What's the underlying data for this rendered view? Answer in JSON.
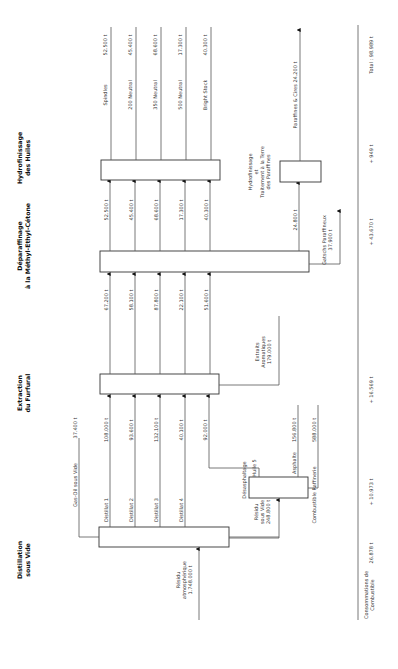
{
  "stages": {
    "distillation": {
      "line1": "Distillation",
      "line2": "sous Vide"
    },
    "extraction": {
      "line1": "Extraction",
      "line2": "du Furfural"
    },
    "deparaffinage": {
      "line1": "Déparaffinage",
      "line2": "à la Méthyl-Ethyl-Cétone"
    },
    "hydrofinissage": {
      "line1": "Hydrofinissage",
      "line2": "des Huiles"
    }
  },
  "feed": {
    "line1": "Résidu",
    "line2": "atmosphérique",
    "line3": "1.748.000 t"
  },
  "gasoil": {
    "label": "Gas-Oil sous Vide",
    "value": "37.400 t"
  },
  "distillates": [
    {
      "label": "Distillat 1",
      "value": "108.000 t"
    },
    {
      "label": "Distillat 2",
      "value": "93.600 t"
    },
    {
      "label": "Distillat 3",
      "value": "132.100 t"
    },
    {
      "label": "Distillat 4",
      "value": "40.100 t"
    },
    {
      "label": "",
      "value": "92.000 t"
    }
  ],
  "residu_vide": {
    "line1": "Résidu",
    "line2": "sous Vide",
    "line3": "248.800 t"
  },
  "desasphaltage": {
    "label": "Désasphaltage",
    "huile5": "Huile 5",
    "asphalte": "Asphalte",
    "asphalte_value": "156.800 t"
  },
  "combustible_raffinerie": {
    "label": "Combustible Raffinerie",
    "value": "588.000 t"
  },
  "raffinats": [
    "67.200 t",
    "58.100 t",
    "87.800 t",
    "22.100 t",
    "51.600 t"
  ],
  "extraits": {
    "line1": "Extraits",
    "line2": "Aromatiques",
    "line3": "179.000 t"
  },
  "deparaffined_oils": [
    "52.500 t",
    "45.400 t",
    "68.600 t",
    "17.300 t",
    "40.300 t"
  ],
  "gatsch": {
    "value": "24.800 t",
    "label": "Gatschs Paraffineux",
    "label_value": "37.900 t"
  },
  "hydrofinissage_paraffines": {
    "line1": "Hydrofinissage",
    "line2": "et",
    "line3": "Traitement à la Terre",
    "line4": "des Paraffines"
  },
  "products": [
    {
      "label": "Spindles",
      "value": "52.500 t"
    },
    {
      "label": "200 Neutral",
      "value": "45.400 t"
    },
    {
      "label": "350 Neutral",
      "value": "68.600 t"
    },
    {
      "label": "500 Neutral",
      "value": "17.300 t"
    },
    {
      "label": "Bright Stock",
      "value": "40.300 t"
    }
  ],
  "paraffines": {
    "label": "Paraffines & Cires 24.200 t"
  },
  "consommations": {
    "line1": "Consommations de",
    "line2": "Combustible",
    "values": [
      "26.878 t",
      "+ 10.973 t",
      "+ 16.569 t",
      "+ 43.670 t",
      "+ 949 t"
    ],
    "total": "Total : 98.989 t"
  }
}
